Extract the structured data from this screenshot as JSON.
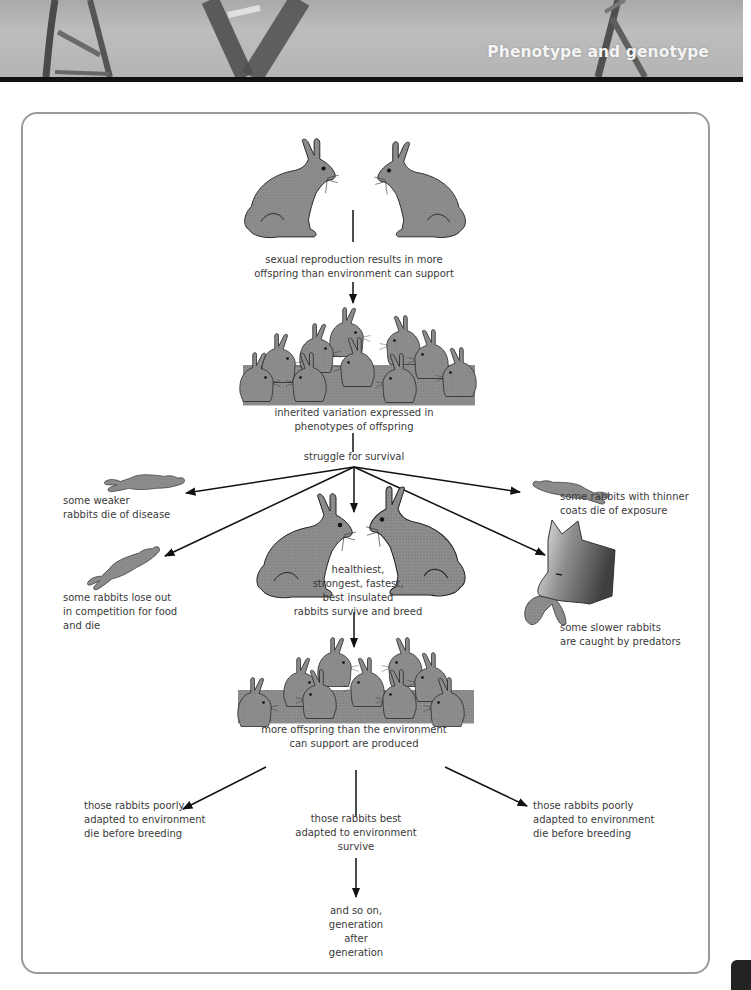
{
  "header": {
    "title": "Phenotype and genotype",
    "background": "dna-helix-photo",
    "bar_color": "#111111"
  },
  "diagram": {
    "frame_color": "#9a9a9a",
    "rabbit_fill": "#8c8c8c",
    "stroke_color": "#222222",
    "steps": {
      "parents_caption": "sexual reproduction results in more\noffspring than environment can support",
      "offspring_caption": "inherited variation expressed in\nphenotypes of offspring",
      "struggle_caption": "struggle for survival",
      "survivors_caption": "healthiest,\nstrongest, fastest,\nbest insulated\nrabbits survive and breed",
      "next_gen_caption": "more offspring than the environment\ncan support are produced",
      "final_caption": "and so on,\ngeneration\nafter\ngeneration"
    },
    "fates": [
      {
        "id": "disease",
        "text": "some weaker\nrabbits die of disease",
        "icon": "dead-rabbit-icon"
      },
      {
        "id": "competition",
        "text": "some rabbits lose out\nin competition for food\nand die",
        "icon": "dead-rabbit-icon"
      },
      {
        "id": "exposure",
        "text": "some rabbits with thinner\ncoats die of exposure",
        "icon": "dead-rabbit-icon"
      },
      {
        "id": "predators",
        "text": "some slower rabbits\nare caught by predators",
        "icon": "fox-with-rabbit-icon"
      }
    ],
    "outcomes": [
      {
        "id": "poor-left",
        "text": "those rabbits poorly\nadapted to environment\ndie before breeding"
      },
      {
        "id": "best",
        "text": "those rabbits best\nadapted to environment\nsurvive"
      },
      {
        "id": "poor-right",
        "text": "those rabbits poorly\nadapted to environment\ndie before breeding"
      }
    ]
  }
}
